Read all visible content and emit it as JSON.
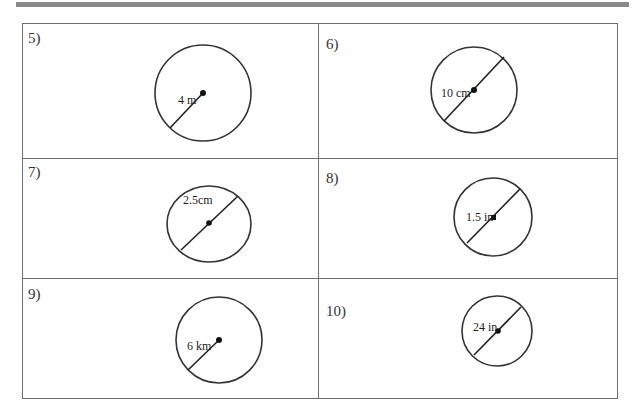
{
  "worksheet": {
    "problems": [
      {
        "number": "5)",
        "label": "4 m",
        "measure": "radius"
      },
      {
        "number": "6)",
        "label": "10 cm",
        "measure": "diameter"
      },
      {
        "number": "7)",
        "label": "2.5cm",
        "measure": "diameter"
      },
      {
        "number": "8)",
        "label": "1.5 in",
        "measure": "diameter"
      },
      {
        "number": "9)",
        "label": "6 km",
        "measure": "radius"
      },
      {
        "number": "10)",
        "label": "24 in",
        "measure": "diameter"
      }
    ]
  }
}
